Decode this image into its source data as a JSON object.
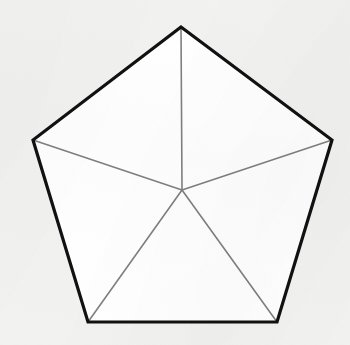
{
  "figure": {
    "name": "regular-pentagon-with-five-triangles",
    "canvas": {
      "width": 350,
      "height": 345
    },
    "colors": {
      "background": "#f2f2f0",
      "interior_fill": "#ffffff",
      "outline": "#111111",
      "spoke": "#808080"
    },
    "strokes": {
      "outline_width": 3.2,
      "spoke_width": 1.6
    },
    "center": {
      "label": "center",
      "x": 182,
      "y": 190
    },
    "vertices": [
      {
        "label": "apex",
        "x": 181,
        "y": 27
      },
      {
        "label": "right",
        "x": 332,
        "y": 140
      },
      {
        "label": "bottom-right",
        "x": 277,
        "y": 322
      },
      {
        "label": "bottom-left",
        "x": 88,
        "y": 322
      },
      {
        "label": "left",
        "x": 33,
        "y": 140
      }
    ],
    "outline_path": "M 181 27 L 332 140 L 277 322 L 88 322 L 33 140 Z",
    "spokes": [
      {
        "label": "spoke-to-apex",
        "d": "M 182 190 L 181 27"
      },
      {
        "label": "spoke-to-right",
        "d": "M 182 190 L 332 140"
      },
      {
        "label": "spoke-to-bottom-right",
        "d": "M 182 190 L 277 322"
      },
      {
        "label": "spoke-to-bottom-left",
        "d": "M 182 190 L 88 322"
      },
      {
        "label": "spoke-to-left",
        "d": "M 182 190 L 33 140"
      }
    ],
    "triangle_count": 5
  }
}
